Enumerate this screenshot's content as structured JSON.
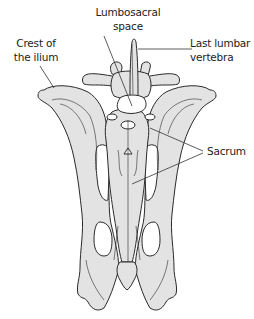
{
  "figure": {
    "colors": {
      "bone_fill": "#e3e3e3",
      "bone_stroke": "#2a2a2a",
      "foramen_fill": "#ffffff",
      "leader_line": "#333333",
      "text": "#222222",
      "background": "#ffffff"
    }
  },
  "labels": {
    "lumbosacral_space": {
      "line1": "Lumbosacral",
      "line2": "space"
    },
    "crest_of_ilium": {
      "line1": "Crest of",
      "line2": "the ilium"
    },
    "last_lumbar_vertebra": {
      "line1": "Last lumbar",
      "line2": "vertebra"
    },
    "sacrum": {
      "line1": "Sacrum"
    }
  }
}
